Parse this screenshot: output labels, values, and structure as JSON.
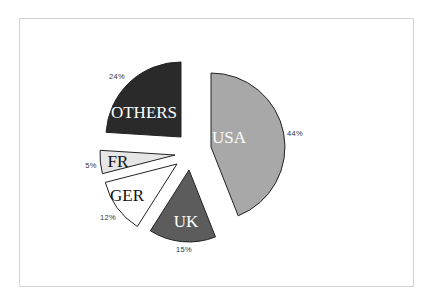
{
  "chart_data": {
    "type": "pie",
    "title": "",
    "exploded": true,
    "start_angle_deg": -90,
    "direction": "clockwise",
    "categories": [
      "USA",
      "UK",
      "GER",
      "FR",
      "OTHERS"
    ],
    "values": [
      44,
      15,
      12,
      5,
      24
    ],
    "unit": "%",
    "slices": [
      {
        "label": "USA",
        "value": 44,
        "pct_label": "44%",
        "color": "#a8a8a8",
        "text_color": "#ffffff"
      },
      {
        "label": "UK",
        "value": 15,
        "pct_label": "15%",
        "color": "#5c5c5c",
        "text_color": "#ffffff"
      },
      {
        "label": "GER",
        "value": 12,
        "pct_label": "12%",
        "color": "#ffffff",
        "text_color": "#111111"
      },
      {
        "label": "FR",
        "value": 5,
        "pct_label": "5%",
        "color": "#e6e6e6",
        "text_color": "#111111"
      },
      {
        "label": "OTHERS",
        "value": 24,
        "pct_label": "24%",
        "color": "#2a2a2a",
        "text_color": "#ffffff"
      }
    ],
    "legend": null
  }
}
